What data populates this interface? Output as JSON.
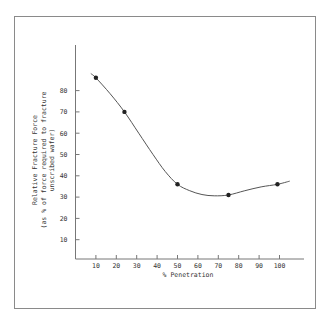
{
  "chart_data": {
    "type": "line",
    "title": "",
    "xlabel": "% Penetration",
    "ylabel_lines": [
      "Relative Fracture Force",
      "(as % of force required to fracture",
      "unscribed wafer)"
    ],
    "x_ticks": [
      10,
      20,
      30,
      40,
      50,
      60,
      70,
      80,
      90,
      100
    ],
    "y_ticks": [
      10,
      20,
      30,
      40,
      50,
      60,
      70,
      80
    ],
    "xlim": [
      0,
      110
    ],
    "ylim": [
      0,
      100
    ],
    "grid": false,
    "series": [
      {
        "name": "Relative Fracture Force",
        "points": [
          {
            "x": 10,
            "y": 86
          },
          {
            "x": 24,
            "y": 70
          },
          {
            "x": 50,
            "y": 36
          },
          {
            "x": 75,
            "y": 31
          },
          {
            "x": 99,
            "y": 36
          }
        ],
        "curve": [
          {
            "x": 7.5,
            "y": 88
          },
          {
            "x": 10,
            "y": 86
          },
          {
            "x": 17,
            "y": 78.5
          },
          {
            "x": 24,
            "y": 70
          },
          {
            "x": 31,
            "y": 60
          },
          {
            "x": 38,
            "y": 50
          },
          {
            "x": 44,
            "y": 42
          },
          {
            "x": 50,
            "y": 36
          },
          {
            "x": 56,
            "y": 33
          },
          {
            "x": 62,
            "y": 31.2
          },
          {
            "x": 68,
            "y": 30.6
          },
          {
            "x": 75,
            "y": 31
          },
          {
            "x": 83,
            "y": 33
          },
          {
            "x": 91,
            "y": 34.8
          },
          {
            "x": 99,
            "y": 36
          },
          {
            "x": 105,
            "y": 37.5
          }
        ]
      }
    ]
  }
}
